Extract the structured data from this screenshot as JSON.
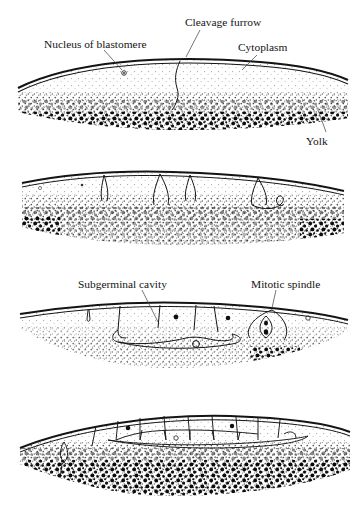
{
  "figure": {
    "background_color": "#ffffff",
    "ink_color": "#141414",
    "yolk_color": "#111111",
    "cytoplasm_color": "#8a8a8a"
  },
  "stages": [
    {
      "id": "stage-1",
      "order": "1",
      "labels": [
        {
          "id": "nucleus-of-blastomere",
          "text": "Nucleus of blastomere"
        },
        {
          "id": "cleavage-furrow",
          "text": "Cleavage furrow"
        },
        {
          "id": "cytoplasm",
          "text": "Cytoplasm"
        },
        {
          "id": "yolk",
          "text": "Yolk"
        }
      ]
    },
    {
      "id": "stage-2",
      "order": "2",
      "labels": []
    },
    {
      "id": "stage-3",
      "order": "3",
      "labels": [
        {
          "id": "subgerminal-cavity",
          "text": "Subgerminal cavity"
        },
        {
          "id": "mitotic-spindle",
          "text": "Mitotic spindle"
        }
      ]
    },
    {
      "id": "stage-4",
      "order": "4",
      "labels": []
    }
  ]
}
